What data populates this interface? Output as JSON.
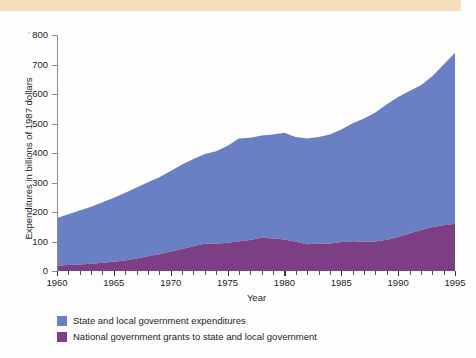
{
  "figure": {
    "band_color": "#f2debb",
    "background": "#fdfdfd"
  },
  "chart_data": {
    "type": "area",
    "stacked": true,
    "title": "",
    "xlabel": "Year",
    "ylabel": "Expenditures in billions of 1987 dollars",
    "xlim": [
      1960,
      1995
    ],
    "ylim": [
      0,
      800
    ],
    "ytick_step": 100,
    "xtick_step": 5,
    "minor_xtick_step": 1,
    "grid": false,
    "legend_position": "below",
    "yticks": [
      "0",
      "100",
      "200",
      "300",
      "400",
      "500",
      "600",
      "700",
      "800"
    ],
    "xticks": [
      "1960",
      "1965",
      "1970",
      "1975",
      "1980",
      "1985",
      "1990",
      "1995"
    ],
    "x": [
      1960,
      1961,
      1962,
      1963,
      1964,
      1965,
      1966,
      1967,
      1968,
      1969,
      1970,
      1971,
      1972,
      1973,
      1974,
      1975,
      1976,
      1977,
      1978,
      1979,
      1980,
      1981,
      1982,
      1983,
      1984,
      1985,
      1986,
      1987,
      1988,
      1989,
      1990,
      1991,
      1992,
      1993,
      1994,
      1995
    ],
    "series": [
      {
        "name": "National government grants to state and local government",
        "color": "#7c3f84",
        "values": [
          18,
          20,
          22,
          25,
          28,
          31,
          36,
          42,
          50,
          57,
          66,
          75,
          84,
          93,
          92,
          96,
          101,
          105,
          113,
          110,
          107,
          99,
          91,
          92,
          93,
          98,
          101,
          99,
          100,
          106,
          115,
          127,
          139,
          148,
          155,
          160
        ]
      },
      {
        "name": "State and local government expenditures",
        "color": "#6b7fc4",
        "values": [
          162,
          172,
          183,
          193,
          205,
          217,
          229,
          241,
          251,
          261,
          273,
          286,
          296,
          304,
          314,
          329,
          348,
          347,
          346,
          353,
          362,
          355,
          358,
          362,
          370,
          382,
          400,
          418,
          437,
          459,
          475,
          483,
          491,
          512,
          545,
          580
        ]
      }
    ],
    "totals": [
      180,
      192,
      205,
      218,
      233,
      248,
      265,
      283,
      301,
      318,
      339,
      361,
      380,
      397,
      406,
      425,
      449,
      452,
      459,
      463,
      469,
      454,
      449,
      454,
      463,
      480,
      501,
      517,
      537,
      565,
      590,
      610,
      630,
      660,
      700,
      740
    ]
  },
  "legend": {
    "items": [
      {
        "label": "State and local government expenditures",
        "color": "#6b7fc4"
      },
      {
        "label": "National government grants to state and local government",
        "color": "#7c3f84"
      }
    ]
  }
}
